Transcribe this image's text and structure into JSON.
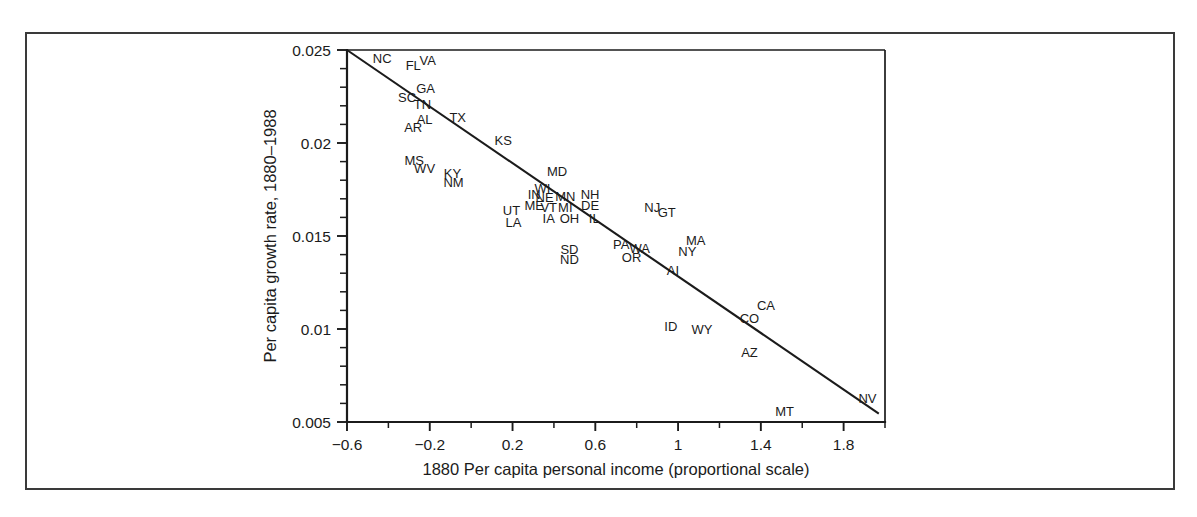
{
  "figure": {
    "background_color": "#ffffff",
    "border_color": "#3a3a3a",
    "ink_color": "#1b1b1b"
  },
  "chart_data": {
    "type": "scatter",
    "title": "",
    "xlabel": "1880 Per capita personal income (proportional scale)",
    "ylabel": "Per capita growth rate, 1880–1988",
    "xlim": [
      -0.6,
      2.0
    ],
    "ylim": [
      0.005,
      0.025
    ],
    "grid": false,
    "legend": null,
    "xticks": [
      -0.6,
      -0.2,
      0.2,
      0.6,
      1,
      1.4,
      1.8
    ],
    "xticklabels": [
      "−0.6",
      "−0.2",
      "0.2",
      "0.6",
      "1",
      "1.4",
      "1.8"
    ],
    "xminor_step": 0.2,
    "yticks": [
      0.005,
      0.01,
      0.015,
      0.02,
      0.025
    ],
    "yticklabels": [
      "0.005",
      "0.01",
      "0.015",
      "0.02",
      "0.025"
    ],
    "yminor_count": 4,
    "marker_style": "text-label",
    "fit_line": {
      "type": "linear",
      "x_start": -0.6,
      "y_start": 0.025,
      "x_end": 1.97,
      "y_end": 0.00545
    },
    "points": [
      {
        "label": "NC",
        "x": -0.43,
        "y": 0.02455
      },
      {
        "label": "FL",
        "x": -0.28,
        "y": 0.02415
      },
      {
        "label": "VA",
        "x": -0.21,
        "y": 0.02445
      },
      {
        "label": "SC",
        "x": -0.31,
        "y": 0.02245
      },
      {
        "label": "GA",
        "x": -0.22,
        "y": 0.02295
      },
      {
        "label": "TN",
        "x": -0.235,
        "y": 0.02205
      },
      {
        "label": "AL",
        "x": -0.225,
        "y": 0.02125
      },
      {
        "label": "AR",
        "x": -0.28,
        "y": 0.02085
      },
      {
        "label": "TX",
        "x": -0.065,
        "y": 0.02135
      },
      {
        "label": "KS",
        "x": 0.155,
        "y": 0.02015
      },
      {
        "label": "MS",
        "x": -0.275,
        "y": 0.01905
      },
      {
        "label": "WV",
        "x": -0.225,
        "y": 0.01865
      },
      {
        "label": "KY",
        "x": -0.09,
        "y": 0.01835
      },
      {
        "label": "NM",
        "x": -0.085,
        "y": 0.01785
      },
      {
        "label": "MD",
        "x": 0.415,
        "y": 0.01845
      },
      {
        "label": "IN",
        "x": 0.305,
        "y": 0.01725
      },
      {
        "label": "WI",
        "x": 0.345,
        "y": 0.01755
      },
      {
        "label": "NE",
        "x": 0.355,
        "y": 0.01705
      },
      {
        "label": "MN",
        "x": 0.455,
        "y": 0.01715
      },
      {
        "label": "NH",
        "x": 0.575,
        "y": 0.01725
      },
      {
        "label": "ME",
        "x": 0.305,
        "y": 0.01665
      },
      {
        "label": "VT",
        "x": 0.375,
        "y": 0.01655
      },
      {
        "label": "MI",
        "x": 0.455,
        "y": 0.01655
      },
      {
        "label": "DE",
        "x": 0.575,
        "y": 0.01665
      },
      {
        "label": "UT",
        "x": 0.195,
        "y": 0.01635
      },
      {
        "label": "LA",
        "x": 0.205,
        "y": 0.01575
      },
      {
        "label": "IA",
        "x": 0.375,
        "y": 0.01595
      },
      {
        "label": "OH",
        "x": 0.475,
        "y": 0.01595
      },
      {
        "label": "IL",
        "x": 0.595,
        "y": 0.01595
      },
      {
        "label": "NJ",
        "x": 0.875,
        "y": 0.01655
      },
      {
        "label": "GT",
        "x": 0.945,
        "y": 0.01625
      },
      {
        "label": "SD",
        "x": 0.475,
        "y": 0.01425
      },
      {
        "label": "ND",
        "x": 0.475,
        "y": 0.01375
      },
      {
        "label": "PA",
        "x": 0.725,
        "y": 0.01455
      },
      {
        "label": "WA",
        "x": 0.815,
        "y": 0.01435
      },
      {
        "label": "OR",
        "x": 0.775,
        "y": 0.01385
      },
      {
        "label": "MA",
        "x": 1.085,
        "y": 0.01475
      },
      {
        "label": "NY",
        "x": 1.045,
        "y": 0.01415
      },
      {
        "label": "AI",
        "x": 0.975,
        "y": 0.01315
      },
      {
        "label": "CA",
        "x": 1.425,
        "y": 0.01125
      },
      {
        "label": "CO",
        "x": 1.345,
        "y": 0.01055
      },
      {
        "label": "ID",
        "x": 0.965,
        "y": 0.01015
      },
      {
        "label": "WY",
        "x": 1.115,
        "y": 0.00995
      },
      {
        "label": "AZ",
        "x": 1.345,
        "y": 0.00875
      },
      {
        "label": "MT",
        "x": 1.515,
        "y": 0.00555
      },
      {
        "label": "NV",
        "x": 1.915,
        "y": 0.00625
      }
    ]
  }
}
